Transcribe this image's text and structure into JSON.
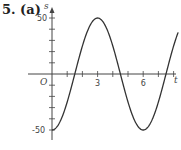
{
  "problem": {
    "label": "5. (a)"
  },
  "chart_data": {
    "type": "line",
    "title": "",
    "xlabel": "t",
    "ylabel": "s",
    "origin_label": "O",
    "x_ticks": [
      1,
      2,
      3,
      4,
      5,
      6,
      7,
      8
    ],
    "x_tick_labels": {
      "3": "3",
      "6": "6"
    },
    "y_ticks": [
      -50,
      -40,
      -30,
      -20,
      -10,
      10,
      20,
      30,
      40,
      50
    ],
    "y_tick_labels": {
      "50": "50",
      "-50": "-50"
    },
    "xlim": [
      -0.5,
      8.5
    ],
    "ylim": [
      -55,
      58
    ],
    "grid": false,
    "series": [
      {
        "name": "s = -50 cos(πt/3)",
        "x": [
          0,
          0.5,
          1,
          1.5,
          2,
          2.5,
          3,
          3.5,
          4,
          4.5,
          5,
          5.5,
          6,
          6.5,
          7,
          7.5,
          8
        ],
        "values": [
          -50,
          -43.3,
          -25,
          0,
          25,
          43.3,
          50,
          43.3,
          25,
          0,
          -25,
          -43.3,
          -50,
          -43.3,
          -25,
          0,
          25
        ]
      }
    ]
  }
}
